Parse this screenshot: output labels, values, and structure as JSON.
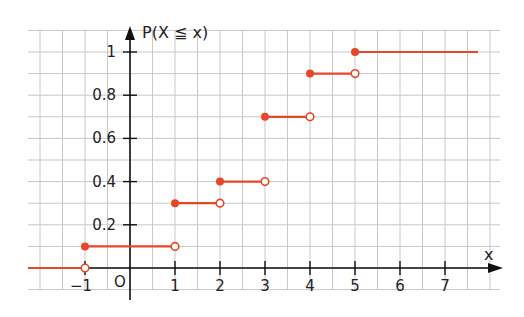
{
  "chart_data": {
    "type": "line",
    "subtype": "step (cumulative distribution function)",
    "title": "",
    "xlabel": "x",
    "ylabel": "P(X ≦ x)",
    "origin_label": "O",
    "xlim": [
      -2.3,
      8.2
    ],
    "ylim": [
      -0.1,
      1.1
    ],
    "x_ticks": [
      -1,
      1,
      2,
      3,
      4,
      5,
      6,
      7
    ],
    "x_tick_labels": [
      "−1",
      "1",
      "2",
      "3",
      "4",
      "5",
      "6",
      "7"
    ],
    "y_ticks": [
      0.2,
      0.4,
      0.6,
      0.8,
      1
    ],
    "y_tick_labels": [
      "0.2",
      "0.4",
      "0.6",
      "0.8",
      "1"
    ],
    "grid": true,
    "grid_step_x": 0.5,
    "grid_step_y": 0.1,
    "segments": [
      {
        "x_start": null,
        "x_end": -1,
        "y": 0,
        "start_closed": null,
        "end_closed": false
      },
      {
        "x_start": -1,
        "x_end": 1,
        "y": 0.1,
        "start_closed": true,
        "end_closed": false
      },
      {
        "x_start": 1,
        "x_end": 2,
        "y": 0.3,
        "start_closed": true,
        "end_closed": false
      },
      {
        "x_start": 2,
        "x_end": 3,
        "y": 0.4,
        "start_closed": true,
        "end_closed": false
      },
      {
        "x_start": 3,
        "x_end": 4,
        "y": 0.7,
        "start_closed": true,
        "end_closed": false
      },
      {
        "x_start": 4,
        "x_end": 5,
        "y": 0.9,
        "start_closed": true,
        "end_closed": false
      },
      {
        "x_start": 5,
        "x_end": null,
        "y": 1.0,
        "start_closed": true,
        "end_closed": null
      }
    ],
    "colors": {
      "step": "#e8462a",
      "axis": "#111111",
      "grid": "#c8c8c8"
    }
  }
}
